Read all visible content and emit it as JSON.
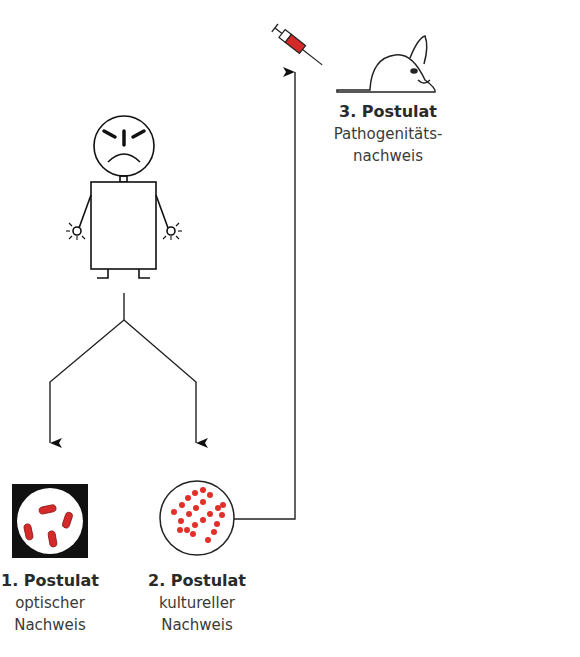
{
  "postulates": [
    {
      "number": "1. Postulat",
      "line1": "optischer",
      "line2": "Nachweis"
    },
    {
      "number": "2. Postulat",
      "line1": "kultureller",
      "line2": "Nachweis"
    },
    {
      "number": "3. Postulat",
      "line1": "Pathogenitäts-",
      "line2": "nachweis"
    }
  ],
  "icons": {
    "sick_person": "sick-person-icon",
    "syringe": "syringe-icon",
    "healthy_mouse": "healthy-mouse-icon",
    "sick_mouse": "sick-mouse-icon",
    "microscope_view": "bacteria-microscope-icon",
    "culture_dish": "culture-dish-icon"
  },
  "colors": {
    "line": "#1a1a1a",
    "bacteria": "#d42a2a",
    "frame": "#111111",
    "background": "#ffffff"
  }
}
